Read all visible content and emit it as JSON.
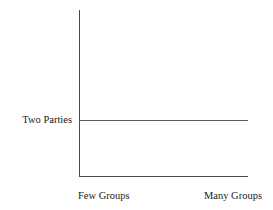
{
  "chart_data": {
    "type": "line",
    "title": "",
    "subtitle": "",
    "xlabel": "",
    "ylabel": "",
    "x": [
      0,
      1
    ],
    "series": [
      {
        "name": "Two Parties",
        "values": [
          1,
          1
        ],
        "style": "flat-horizontal"
      }
    ],
    "y_axis": {
      "tick_labels": [
        "Two Parties"
      ],
      "tick_values": [
        1
      ],
      "range": [
        0,
        2
      ]
    },
    "x_axis": {
      "tick_labels": [
        "Few Groups",
        "Many Groups"
      ],
      "tick_values": [
        0,
        1
      ],
      "range": [
        0,
        1
      ]
    },
    "grid": false,
    "legend": null,
    "annotations": []
  },
  "labels": {
    "y_axis_label": "Two Parties",
    "x_axis_left": "Few Groups",
    "x_axis_right": "Many Groups"
  },
  "colors": {
    "background": "#ffffff",
    "axis": "#4a4a4a",
    "series": "#5e5e5e",
    "text": "#1a1a1a"
  }
}
